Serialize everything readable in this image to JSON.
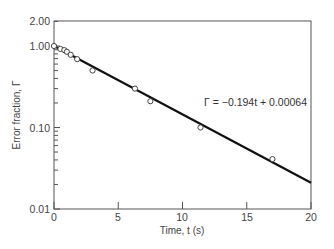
{
  "chart_data": {
    "type": "scatter",
    "title": "",
    "xlabel": "Time, t (s)",
    "ylabel": "Error fraction, Γ",
    "xlim": [
      0,
      20
    ],
    "ylim": [
      0.01,
      2.0
    ],
    "yscale": "log",
    "grid": false,
    "x_ticks": [
      0,
      5,
      10,
      15,
      20
    ],
    "x_tick_labels": [
      "0",
      "5",
      "10",
      "15",
      "20"
    ],
    "y_ticks": [
      0.01,
      0.1,
      1.0,
      2.0
    ],
    "y_tick_labels": [
      "0.01",
      "0.10",
      "1.00",
      "2.00"
    ],
    "series": [
      {
        "name": "measured",
        "marker": "open-circle",
        "x": [
          0,
          0.5,
          0.8,
          1.0,
          1.3,
          1.8,
          3.0,
          6.3,
          7.5,
          11.4,
          17.0
        ],
        "y": [
          1.0,
          0.92,
          0.89,
          0.85,
          0.78,
          0.69,
          0.5,
          0.3,
          0.21,
          0.1,
          0.041
        ]
      },
      {
        "name": "fit",
        "line": "solid",
        "x": [
          0,
          20
        ],
        "y": [
          1.0,
          0.021
        ]
      }
    ],
    "annotations": [
      {
        "text": "Γ = −0.194t + 0.00064",
        "x": 12.6,
        "y": 0.3
      }
    ]
  },
  "labels": {
    "xlabel": "Time, t (s)",
    "ylabel": "Error fraction, Γ",
    "equation": "Γ = −0.194t + 0.00064",
    "x_ticks": [
      "0",
      "5",
      "10",
      "15",
      "20"
    ],
    "y_ticks": [
      "2.00",
      "1.00",
      "0.10",
      "0.01"
    ]
  }
}
